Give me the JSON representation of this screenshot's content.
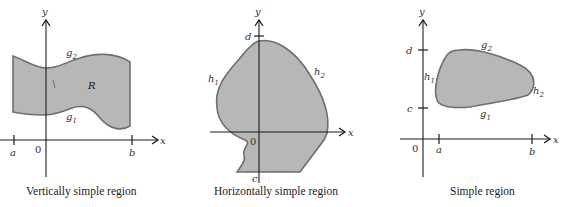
{
  "panels": [
    {
      "caption": "Vertically simple region",
      "axis_x": "x",
      "axis_y": "y",
      "origin": "0",
      "ticks_x": [
        "a",
        "b"
      ],
      "curve_upper": {
        "base": "g",
        "sub": "2"
      },
      "curve_lower": {
        "base": "g",
        "sub": "1"
      },
      "region_label": "R"
    },
    {
      "caption": "Horizontally simple region",
      "axis_x": "x",
      "axis_y": "y",
      "origin": "0",
      "ticks_y": [
        "d",
        "c"
      ],
      "curve_left": {
        "base": "h",
        "sub": "1"
      },
      "curve_right": {
        "base": "h",
        "sub": "2"
      }
    },
    {
      "caption": "Simple region",
      "axis_x": "x",
      "axis_y": "y",
      "origin": "0",
      "ticks_x": [
        "a",
        "b"
      ],
      "ticks_y": [
        "d",
        "c"
      ],
      "curve_upper": {
        "base": "g",
        "sub": "2"
      },
      "curve_lower": {
        "base": "g",
        "sub": "1"
      },
      "curve_left": {
        "base": "h",
        "sub": "1"
      },
      "curve_right": {
        "base": "h",
        "sub": "2"
      }
    }
  ],
  "colors": {
    "region_fill": "#b7b7b7",
    "region_stroke": "#6e6e6e",
    "axis": "#1a1a1a"
  }
}
